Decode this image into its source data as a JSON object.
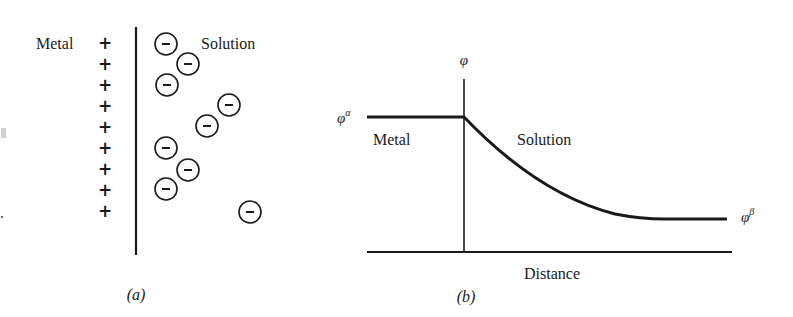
{
  "panel_a": {
    "caption": "(a)",
    "metal_label": "Metal",
    "solution_label": "Solution",
    "plus_symbol": "+",
    "minus_symbol": "−",
    "plus_charges_y": [
      43,
      64,
      85,
      106,
      127,
      148,
      169,
      190,
      211
    ],
    "negative_ions": [
      {
        "x": 166,
        "y": 44
      },
      {
        "x": 188,
        "y": 64
      },
      {
        "x": 167,
        "y": 85
      },
      {
        "x": 229,
        "y": 105
      },
      {
        "x": 207,
        "y": 126
      },
      {
        "x": 166,
        "y": 148
      },
      {
        "x": 188,
        "y": 170
      },
      {
        "x": 166,
        "y": 189
      },
      {
        "x": 250,
        "y": 212
      }
    ]
  },
  "panel_b": {
    "caption": "(b)",
    "y_axis_label": "φ",
    "phi_alpha_label": "φ",
    "phi_alpha_sup": "α",
    "phi_beta_label": "φ",
    "phi_beta_sup": "β",
    "metal_label": "Metal",
    "solution_label": "Solution",
    "x_axis_label": "Distance"
  },
  "colors": {
    "ink": "#1a1a1a",
    "background": "#ffffff",
    "artifact": "#c8c8c8"
  }
}
